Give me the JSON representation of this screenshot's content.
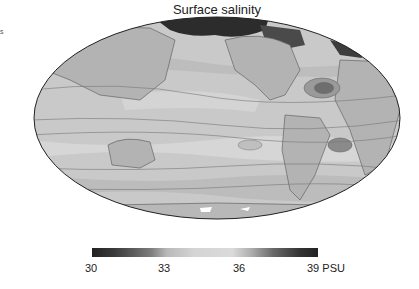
{
  "figure": {
    "title": "Surface salinity",
    "edge_text": "s",
    "projection": "Mollweide",
    "colormap": "grayscale diverging (dark low/high, light mid)"
  },
  "colorbar": {
    "unit": "PSU",
    "min": 30,
    "max": 39,
    "ticks": [
      {
        "value": "30",
        "label": "30"
      },
      {
        "value": "33",
        "label": "33"
      },
      {
        "value": "36",
        "label": "36"
      },
      {
        "value": "39",
        "label": "39 PSU"
      }
    ]
  },
  "colors": {
    "ocean_mid": "#c8c8c8",
    "land": "#b4b4b4",
    "contour": "#707070",
    "low_salinity": "#2a2a2a",
    "high_salinity": "#6e6e6e",
    "outline": "#222222"
  }
}
